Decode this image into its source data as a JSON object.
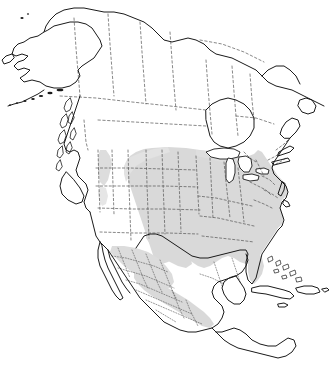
{
  "figure": {
    "caption": "Range",
    "caption_note": "serif bold label cropped at top edge of image",
    "width": 330,
    "height": 367,
    "background_color": "#ffffff"
  },
  "map": {
    "title": "Range",
    "kind": "species-distribution-range-map",
    "region": "North America",
    "projection_look": "conic",
    "colors": {
      "background": "#ffffff",
      "land_outline": "#1a1a1a",
      "internal_border": "#555555",
      "range_fill": "#d9d9d9",
      "range_fill_light": "#e4e4e4",
      "lake_fill": "#ffffff",
      "caption_text": "#1b1b1b"
    },
    "line_styles": {
      "coastline": "solid",
      "country_border": "solid",
      "state_province_border": "dashed",
      "mexico_state_border": "dotted"
    },
    "legend": {
      "present": false,
      "shaded_meaning": "shaded gray = species range"
    },
    "landmasses": [
      {
        "name": "Alaska",
        "shaded": false
      },
      {
        "name": "Aleutian Islands",
        "shaded": false
      },
      {
        "name": "Canada (Yukon, NWT, Nunavut)",
        "shaded": false
      },
      {
        "name": "British Columbia coast and islands",
        "shaded": false
      },
      {
        "name": "Canadian Prairies",
        "shaded": false
      },
      {
        "name": "Ontario and Quebec",
        "shaded": false
      },
      {
        "name": "Labrador and Newfoundland",
        "shaded": false
      },
      {
        "name": "Western United States",
        "shaded": false
      },
      {
        "name": "Pacific Northwest patch",
        "shaded": true
      },
      {
        "name": "Great Plains",
        "shaded": true
      },
      {
        "name": "Midwest and Great Lakes states",
        "shaded": true
      },
      {
        "name": "Eastern United States",
        "shaded": true
      },
      {
        "name": "Southeastern United States",
        "shaded": true
      },
      {
        "name": "Florida",
        "shaded": true
      },
      {
        "name": "Texas and Gulf Coast",
        "shaded": true
      },
      {
        "name": "Baja California",
        "shaded": false
      },
      {
        "name": "Northern Mexico",
        "shaded": true
      },
      {
        "name": "Mexican highlands",
        "shaded": true
      },
      {
        "name": "Yucatan Peninsula",
        "shaded": false
      },
      {
        "name": "Central America",
        "shaded": false
      },
      {
        "name": "Cuba",
        "shaded": false
      },
      {
        "name": "Bahamas",
        "shaded": false
      },
      {
        "name": "Hispaniola",
        "shaded": false
      },
      {
        "name": "Great Lakes",
        "shaded": false
      }
    ],
    "range_extent_summary": "Continuous shading over the central and eastern United States from the Great Plains east to the Atlantic coast and south through Texas into the Mexican highlands, plus a small isolated patch in the Pacific Northwest."
  }
}
